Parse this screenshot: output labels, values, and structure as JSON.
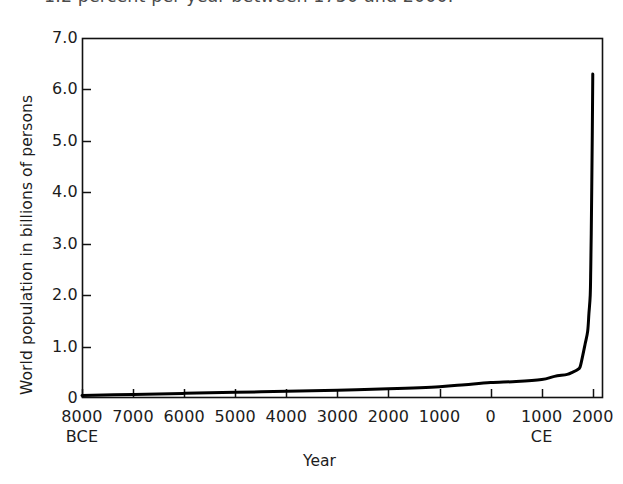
{
  "caption": {
    "clipped_line": "1.2 percent per year between 1750 and 2000."
  },
  "figure": {
    "xlabel": "Year",
    "ylabel": "World population in billions of persons"
  },
  "chart_data": {
    "type": "line",
    "title": "",
    "xlabel": "Year",
    "ylabel": "World population in billions of persons",
    "xlim": [
      -8000,
      2200
    ],
    "ylim": [
      0,
      7.0
    ],
    "grid": false,
    "legend": null,
    "xtick_values": [
      -8000,
      -7000,
      -6000,
      -5000,
      -4000,
      -3000,
      -2000,
      -1000,
      0,
      1000,
      2000
    ],
    "xtick_labels": [
      "8000",
      "7000",
      "6000",
      "5000",
      "4000",
      "3000",
      "2000",
      "1000",
      "0",
      "1000",
      "2000"
    ],
    "xtick_era_labels": [
      {
        "at": -8000,
        "text": "BCE"
      },
      {
        "at": 1000,
        "text": "CE"
      }
    ],
    "ytick_values": [
      0,
      1.0,
      2.0,
      3.0,
      4.0,
      5.0,
      6.0,
      7.0
    ],
    "ytick_labels": [
      "0",
      "1.0",
      "2.0",
      "3.0",
      "4.0",
      "5.0",
      "6.0",
      "7.0"
    ],
    "series": [
      {
        "name": "World population",
        "color": "#000000",
        "x": [
          -8000,
          -7000,
          -6000,
          -5000,
          -4000,
          -3000,
          -2000,
          -1000,
          -500,
          0,
          500,
          1000,
          1250,
          1500,
          1600,
          1700,
          1750,
          1800,
          1850,
          1900,
          1925,
          1950,
          1960,
          1970,
          1980,
          1990,
          2000
        ],
        "y": [
          0.05,
          0.07,
          0.09,
          0.11,
          0.13,
          0.15,
          0.18,
          0.22,
          0.26,
          0.3,
          0.32,
          0.36,
          0.42,
          0.46,
          0.5,
          0.55,
          0.6,
          0.81,
          1.05,
          1.3,
          1.65,
          2.0,
          2.5,
          3.2,
          4.1,
          5.1,
          6.3
        ]
      }
    ],
    "annotations": []
  },
  "geometry": {
    "plot_left": 82,
    "plot_right": 603,
    "plot_top": 38,
    "plot_bottom": 398
  }
}
